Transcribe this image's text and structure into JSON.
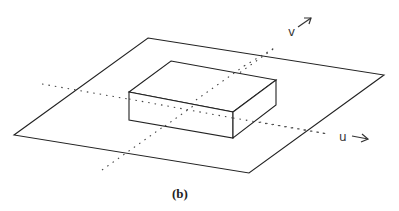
{
  "figure": {
    "caption": "(b)"
  },
  "axes": {
    "u": {
      "label": "u",
      "arrow": "→"
    },
    "v": {
      "label": "v",
      "arrow": "↗"
    }
  },
  "colors": {
    "line": "#222222",
    "dotted": "#444444",
    "background": "#ffffff"
  }
}
